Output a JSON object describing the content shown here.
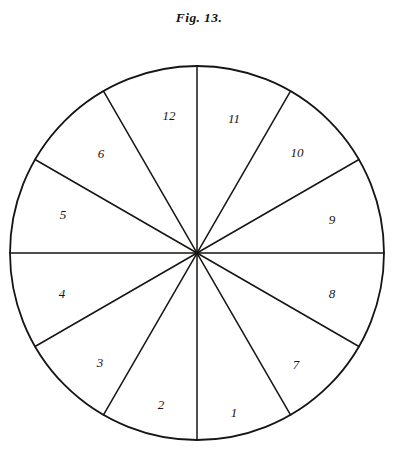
{
  "figure": {
    "caption": "Fig. 13.",
    "title_text": "Fig. 13.",
    "type": "sector-circle-diagram",
    "ink_color": "#171412",
    "background_color": "#ffffff",
    "geometry": {
      "center_x": 197,
      "center_y": 253,
      "radius": 187,
      "sector_count": 12,
      "sector_angle_degrees": 30,
      "spoke_count": 12
    },
    "sectors": [
      {
        "label": "1",
        "label_x": 234,
        "label_y": 412
      },
      {
        "label": "2",
        "label_x": 161,
        "label_y": 404
      },
      {
        "label": "3",
        "label_x": 100,
        "label_y": 362
      },
      {
        "label": "4",
        "label_x": 62,
        "label_y": 293
      },
      {
        "label": "5",
        "label_x": 63,
        "label_y": 214
      },
      {
        "label": "6",
        "label_x": 101,
        "label_y": 153
      },
      {
        "label": "12",
        "label_x": 169,
        "label_y": 115
      },
      {
        "label": "11",
        "label_x": 234,
        "label_y": 118
      },
      {
        "label": "10",
        "label_x": 297,
        "label_y": 152
      },
      {
        "label": "9",
        "label_x": 332,
        "label_y": 219
      },
      {
        "label": "8",
        "label_x": 332,
        "label_y": 293
      },
      {
        "label": "7",
        "label_x": 296,
        "label_y": 364
      }
    ]
  }
}
